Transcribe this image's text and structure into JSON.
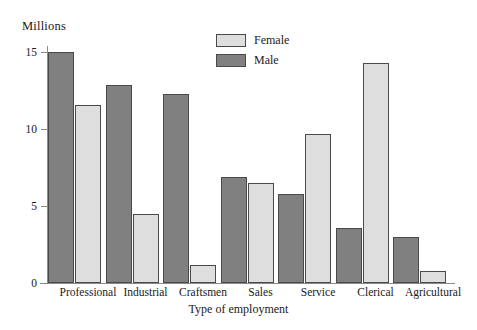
{
  "chart_data": {
    "type": "bar",
    "title": "",
    "ylabel": "Millions",
    "xlabel": "Type of employment",
    "categories": [
      "Professional",
      "Industrial",
      "Craftsmen",
      "Sales",
      "Service",
      "Clerical",
      "Agricultural"
    ],
    "series": [
      {
        "name": "Female",
        "color": "#dedede",
        "values": [
          11.6,
          4.5,
          1.2,
          6.5,
          9.7,
          14.3,
          0.8
        ]
      },
      {
        "name": "Male",
        "color": "#808080",
        "values": [
          15.0,
          12.9,
          12.3,
          6.9,
          5.8,
          3.6,
          3.0
        ]
      }
    ],
    "ylim": [
      0,
      15.8
    ],
    "yticks": [
      0,
      5,
      10,
      15
    ],
    "ytick_labels": [
      "0",
      "5",
      "10",
      "15"
    ],
    "grid": false,
    "legend_position": "top-center",
    "legend_entries": [
      "Female",
      "Male"
    ]
  }
}
